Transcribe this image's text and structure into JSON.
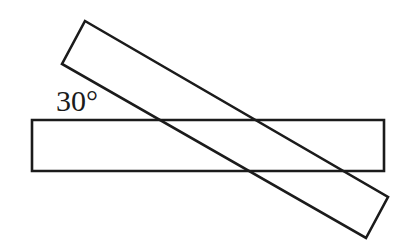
{
  "figure": {
    "background_color": "#ffffff",
    "stroke_color": "#1b1b1b",
    "stroke_width": 2.6,
    "canvas": {
      "width": 406,
      "height": 241
    },
    "labels": {
      "angle": "30°",
      "angle_value": 30,
      "angle_unit": "degrees"
    },
    "shapes": {
      "horizontal_rectangle": {
        "name": "horizontal-strip",
        "points": "32,120 384,120 384,171 32,171",
        "x": 32,
        "y": 120,
        "width": 352,
        "height": 51,
        "rotation_deg": 0
      },
      "diagonal_rectangle": {
        "name": "diagonal-strip",
        "points": "85,21 388,197 366,238 62,64",
        "rotation_deg": -30,
        "corners": [
          {
            "label": "top-left",
            "x": 85,
            "y": 21
          },
          {
            "label": "right-upper",
            "x": 388,
            "y": 197
          },
          {
            "label": "bottom-right",
            "x": 366,
            "y": 238
          },
          {
            "label": "left-lower",
            "x": 62,
            "y": 64
          }
        ]
      }
    },
    "intersections": [
      {
        "name": "upper-left-crossing",
        "x": 155,
        "y": 120
      },
      {
        "name": "upper-right-crossing",
        "x": 262,
        "y": 120
      },
      {
        "name": "lower-left-crossing",
        "x": 244,
        "y": 171
      },
      {
        "name": "lower-right-crossing",
        "x": 350,
        "y": 171
      }
    ]
  }
}
